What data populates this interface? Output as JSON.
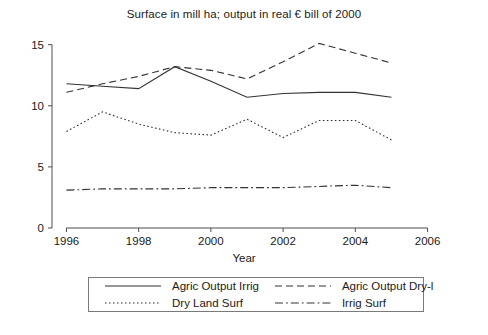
{
  "chart_data": {
    "type": "line",
    "title": "Surface in mill ha; output in real € bill of 2000",
    "xlabel": "Year",
    "ylabel": "",
    "xlim": [
      1995.6,
      2006.4
    ],
    "ylim": [
      0,
      16.2
    ],
    "xticks": [
      1996,
      1998,
      2000,
      2002,
      2004,
      2006
    ],
    "yticks": [
      0,
      5,
      10,
      15
    ],
    "grid": false,
    "legend_position": "below",
    "x": [
      1996,
      1997,
      1998,
      1999,
      2000,
      2001,
      2002,
      2003,
      2004,
      2005
    ],
    "series": [
      {
        "name": "Agric Output Irrig",
        "style": "solid",
        "values": [
          11.8,
          11.6,
          11.4,
          13.2,
          12.0,
          10.7,
          11.0,
          11.1,
          11.1,
          10.7
        ]
      },
      {
        "name": "Agric Output Dry-l",
        "style": "dashed",
        "values": [
          11.1,
          11.8,
          12.4,
          13.2,
          12.9,
          12.2,
          13.6,
          15.1,
          14.3,
          13.5
        ]
      },
      {
        "name": "Dry Land Surf",
        "style": "dotted",
        "values": [
          7.9,
          9.5,
          8.5,
          7.8,
          7.6,
          8.9,
          7.4,
          8.8,
          8.8,
          7.2
        ]
      },
      {
        "name": "Irrig Surf",
        "style": "dashdot",
        "values": [
          3.1,
          3.2,
          3.2,
          3.2,
          3.3,
          3.3,
          3.3,
          3.4,
          3.5,
          3.3
        ]
      }
    ]
  },
  "legend": {
    "entries": [
      {
        "label": "Agric Output Irrig",
        "style": "solid"
      },
      {
        "label": "Agric Output Dry-l",
        "style": "dashed"
      },
      {
        "label": "Dry Land Surf",
        "style": "dotted"
      },
      {
        "label": "Irrig Surf",
        "style": "dashdot"
      }
    ]
  },
  "colors": {
    "line": "#333333",
    "axis": "#4d4d4d",
    "text": "#1a1a1a",
    "background": "#ffffff"
  }
}
